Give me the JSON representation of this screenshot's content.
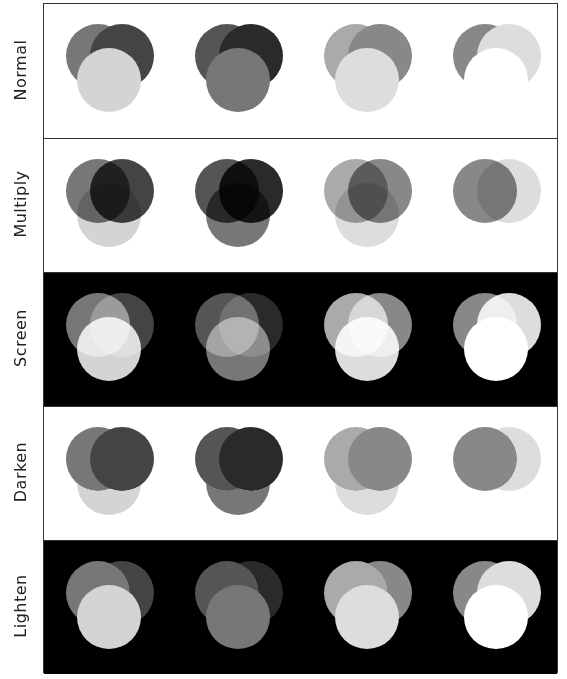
{
  "figure": {
    "title": "",
    "background_colors": {
      "white": "#ffffff",
      "black": "#000000"
    },
    "columns": [
      {
        "index": 1,
        "circles": {
          "left": "#777777",
          "right": "#444444",
          "bottom": "#d4d4d4"
        }
      },
      {
        "index": 2,
        "circles": {
          "left": "#555555",
          "right": "#2a2a2a",
          "bottom": "#777777"
        }
      },
      {
        "index": 3,
        "circles": {
          "left": "#aaaaaa",
          "right": "#888888",
          "bottom": "#dddddd"
        }
      },
      {
        "index": 4,
        "circles": {
          "left": "#888888",
          "right": "#dddddd",
          "bottom": "#ffffff"
        }
      }
    ],
    "rows": [
      {
        "label": "Normal",
        "blend_mode": "normal",
        "background": "#ffffff"
      },
      {
        "label": "Multiply",
        "blend_mode": "multiply",
        "background": "#ffffff"
      },
      {
        "label": "Screen",
        "blend_mode": "screen",
        "background": "#000000"
      },
      {
        "label": "Darken",
        "blend_mode": "darken",
        "background": "#ffffff"
      },
      {
        "label": "Lighten",
        "blend_mode": "lighten",
        "background": "#000000"
      }
    ]
  }
}
